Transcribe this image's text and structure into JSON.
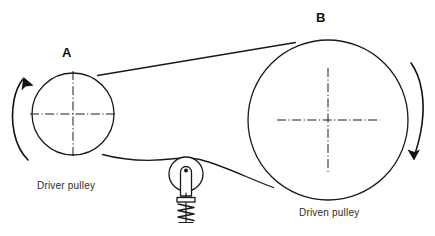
{
  "figure": {
    "background_color": "#ffffff",
    "line_color": "#1a1a1a",
    "text_color": "#2b2b2b",
    "width": 435,
    "height": 236
  },
  "labels": {
    "pulley_a": "A",
    "pulley_b": "B"
  },
  "captions": {
    "driver": "Driver pulley",
    "driven": "Driven pulley"
  },
  "components": {
    "driver_pulley": {
      "name": "A",
      "caption": "Driver pulley",
      "center_x": 73,
      "center_y": 114,
      "radius": 41,
      "rotation": "counter-clockwise"
    },
    "driven_pulley": {
      "name": "B",
      "caption": "Driven pulley",
      "center_x": 328,
      "center_y": 120,
      "radius": 80,
      "rotation": "clockwise"
    },
    "idler_pulley": {
      "center_x": 186,
      "center_y": 174,
      "radius": 17,
      "spring_loaded": true
    },
    "belt": {
      "upper_span": "from (98,75) on A to (295,42) on B",
      "lower_span": "from (103,155) on A over idler (186,157) to (273,187) on B"
    }
  },
  "rotation_arrows": {
    "left": {
      "direction": "counter-clockwise",
      "arrowhead": "top"
    },
    "right": {
      "direction": "clockwise",
      "arrowhead": "bottom"
    }
  },
  "centerlines": {
    "style": "dash-dot",
    "present_on": [
      "driver_pulley",
      "driven_pulley"
    ]
  }
}
